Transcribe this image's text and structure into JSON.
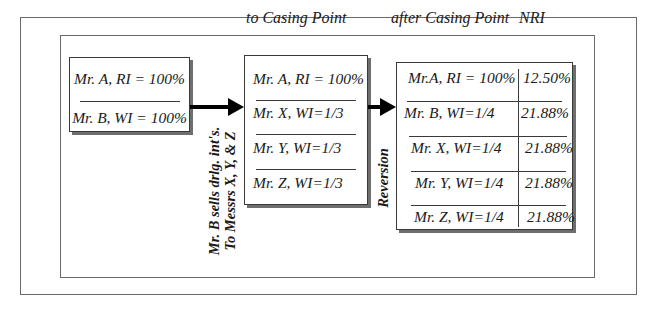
{
  "headers": {
    "to_casing_point": "to Casing Point",
    "after_casing_point": "after Casing Point",
    "nri": "NRI"
  },
  "before": {
    "rows": [
      "Mr. A, RI = 100%",
      "Mr. B, WI = 100%"
    ]
  },
  "transfer_note": {
    "line1": "Mr. B sells drlg. int's.",
    "line2": "To Messrs X, Y, & Z"
  },
  "to_casing_point": {
    "rows": [
      "Mr. A, RI = 100%",
      "Mr. X, WI=1/3",
      "Mr. Y, WI=1/3",
      "Mr. Z, WI=1/3"
    ]
  },
  "reversion_label": "Reversion",
  "after_casing_point": {
    "rows": [
      {
        "owner": "Mr.A, RI = 100%",
        "nri": "12.50%"
      },
      {
        "owner": "Mr. B, WI=1/4",
        "nri": "21.88%"
      },
      {
        "owner": "Mr. X, WI=1/4",
        "nri": "21.88%"
      },
      {
        "owner": "Mr. Y, WI=1/4",
        "nri": "21.88%"
      },
      {
        "owner": "Mr. Z, WI=1/4",
        "nri": "21.88%"
      }
    ]
  }
}
